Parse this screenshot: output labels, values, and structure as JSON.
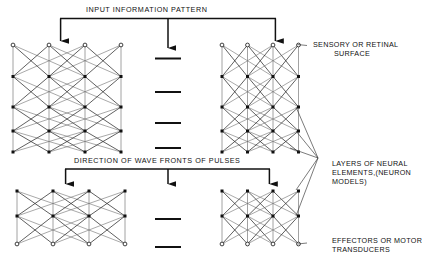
{
  "figure": {
    "title_top": "INPUT  INFORMATION   PATTERN",
    "title_mid": "DIRECTION  OF  WAVE  FRONTS  OF  PULSES",
    "labels": {
      "sensory_line1": "SENSORY OR RETINAL",
      "sensory_line2": "SURFACE",
      "layers_line1": "LAYERS OF NEURAL",
      "layers_line2": "ELEMENTS,(NEURON",
      "layers_line3": "MODELS)",
      "effectors_line1": "EFFECTORS OR MOTOR",
      "effectors_line2": "TRANSDUCERS"
    },
    "colors": {
      "ink": "#111111",
      "line": "#333333",
      "faint": "#777777",
      "background": "#ffffff"
    },
    "ellipsis_dash_count": 3,
    "network_columns": 4,
    "network_rows_top": 5,
    "network_rows_bottom": 3,
    "arrow_count_top": 3,
    "arrow_count_mid": 3
  }
}
